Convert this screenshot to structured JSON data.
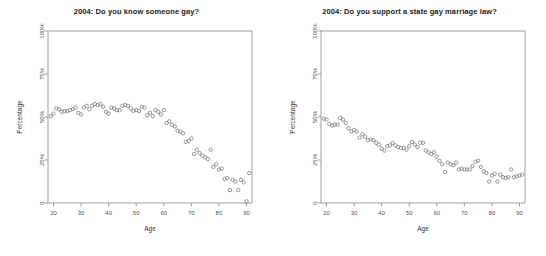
{
  "figure": {
    "background_color": "#ffffff",
    "marker_color": "#777777",
    "axis_color": "#888888",
    "text_color": "#333333"
  },
  "chart_data": [
    {
      "type": "scatter",
      "id": "know-someone-gay",
      "title": "2004: Do you know someone gay?",
      "xlabel": "Age",
      "ylabel": "Percentage",
      "xlim": [
        18,
        92
      ],
      "ylim": [
        0,
        100
      ],
      "grid": false,
      "legend": "none",
      "xticks": [
        20,
        30,
        40,
        50,
        60,
        70,
        80,
        90
      ],
      "xticklabels": [
        "20",
        "30",
        "40",
        "50",
        "60",
        "70",
        "80",
        "90"
      ],
      "yticks": [
        0,
        25,
        50,
        75,
        100
      ],
      "yticklabels": [
        "0",
        "25%",
        "50%",
        "75%",
        "100%"
      ],
      "x": [
        19,
        20,
        21,
        22,
        23,
        24,
        25,
        26,
        27,
        28,
        29,
        30,
        31,
        32,
        33,
        34,
        35,
        36,
        37,
        38,
        39,
        40,
        41,
        42,
        43,
        44,
        45,
        46,
        47,
        48,
        49,
        50,
        51,
        52,
        53,
        54,
        55,
        56,
        57,
        58,
        59,
        60,
        61,
        62,
        63,
        64,
        65,
        66,
        67,
        68,
        69,
        70,
        71,
        72,
        73,
        74,
        75,
        76,
        77,
        78,
        79,
        80,
        81,
        82,
        83,
        84,
        85,
        86,
        87,
        88,
        89,
        90,
        91
      ],
      "y": [
        50.5,
        52.0,
        55.0,
        54.5,
        53.0,
        53.5,
        53.5,
        54.0,
        54.5,
        55.5,
        52.5,
        51.5,
        55.5,
        56.5,
        54.5,
        56.5,
        57.5,
        57.0,
        57.5,
        56.0,
        53.0,
        52.0,
        55.5,
        55.0,
        54.0,
        54.0,
        56.5,
        57.0,
        56.5,
        55.0,
        53.5,
        54.0,
        53.5,
        56.0,
        55.5,
        51.0,
        52.5,
        50.5,
        54.0,
        53.0,
        51.5,
        54.0,
        46.5,
        47.5,
        45.5,
        44.5,
        42.0,
        41.5,
        40.5,
        35.5,
        36.0,
        37.5,
        28.5,
        31.0,
        29.0,
        27.5,
        26.5,
        25.5,
        31.0,
        21.0,
        22.5,
        19.5,
        20.0,
        14.0,
        14.5,
        7.5,
        13.5,
        12.5,
        7.5,
        13.5,
        12.0,
        1.0,
        17.5
      ]
    },
    {
      "type": "scatter",
      "id": "support-state-gay-marriage-law",
      "title": "2004: Do you support a state gay marriage law?",
      "xlabel": "Age",
      "ylabel": "Percentage",
      "xlim": [
        18,
        92
      ],
      "ylim": [
        0,
        100
      ],
      "grid": false,
      "legend": "none",
      "xticks": [
        20,
        30,
        40,
        50,
        60,
        70,
        80,
        90
      ],
      "xticklabels": [
        "20",
        "30",
        "40",
        "50",
        "60",
        "70",
        "80",
        "90"
      ],
      "yticks": [
        0,
        25,
        50,
        75,
        100
      ],
      "yticklabels": [
        "0",
        "25%",
        "50%",
        "75%",
        "100%"
      ],
      "x": [
        19,
        20,
        21,
        22,
        23,
        24,
        25,
        26,
        27,
        28,
        29,
        30,
        31,
        32,
        33,
        34,
        35,
        36,
        37,
        38,
        39,
        40,
        41,
        42,
        43,
        44,
        45,
        46,
        47,
        48,
        49,
        50,
        51,
        52,
        53,
        54,
        55,
        56,
        57,
        58,
        59,
        60,
        61,
        62,
        63,
        64,
        65,
        66,
        67,
        68,
        69,
        70,
        71,
        72,
        73,
        74,
        75,
        76,
        77,
        78,
        79,
        80,
        81,
        82,
        83,
        84,
        85,
        86,
        87,
        88,
        89,
        90,
        91
      ],
      "y": [
        49.0,
        48.5,
        46.0,
        45.0,
        45.5,
        45.5,
        49.5,
        48.5,
        46.5,
        43.5,
        41.5,
        42.5,
        41.5,
        38.0,
        40.0,
        38.5,
        36.5,
        37.0,
        36.5,
        35.0,
        34.0,
        31.5,
        30.5,
        33.0,
        33.5,
        35.0,
        33.5,
        32.5,
        32.0,
        32.0,
        31.0,
        33.0,
        35.5,
        34.0,
        32.5,
        35.0,
        35.0,
        30.5,
        29.5,
        28.5,
        29.5,
        27.0,
        24.5,
        22.5,
        18.0,
        23.5,
        22.5,
        22.0,
        23.5,
        19.5,
        20.0,
        19.5,
        19.5,
        19.5,
        21.5,
        24.0,
        24.5,
        21.0,
        18.5,
        17.5,
        12.5,
        16.0,
        17.0,
        12.5,
        16.5,
        15.0,
        14.5,
        15.0,
        19.5,
        15.0,
        15.5,
        16.0,
        16.5
      ]
    }
  ]
}
